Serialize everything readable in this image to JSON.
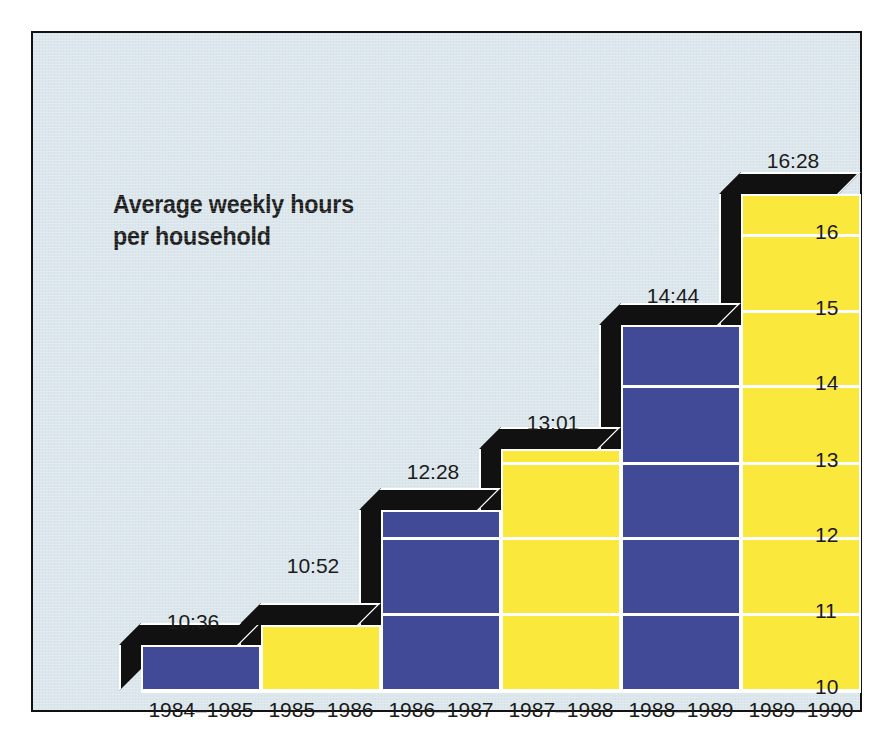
{
  "chart_data": {
    "type": "bar",
    "title": "Average weekly hours\nper household",
    "xlabel": "",
    "ylabel": "",
    "ylim": [
      10,
      16.8
    ],
    "grid": true,
    "legend": "none",
    "categories": [
      "1984–1985",
      "1985–1986",
      "1986–1987",
      "1987–1988",
      "1988–1989",
      "1989–1990"
    ],
    "value_labels": [
      "10:36",
      "10:52",
      "12:28",
      "13:01",
      "14:44",
      "16:28"
    ],
    "values": [
      10.6,
      10.867,
      12.467,
      13.017,
      14.733,
      16.467
    ],
    "bar_colors": [
      "#414a96",
      "#fbe83c",
      "#414a96",
      "#fbe83c",
      "#414a96",
      "#fbe83c"
    ],
    "ytick_labels": [
      "16",
      "15",
      "14",
      "13",
      "12",
      "11",
      "10"
    ],
    "yticks": [
      16,
      15,
      14,
      13,
      12,
      11,
      10
    ],
    "colors": {
      "background": "#dbe7ec",
      "blue": "#414a96",
      "yellow": "#fbe83c",
      "shadow": "#111111",
      "gridline": "#ffffff",
      "border": "#111111",
      "text": "#1b1b1b"
    }
  },
  "axis": {
    "ticks": [
      {
        "label": "16",
        "y": 201
      },
      {
        "label": "15",
        "y": 277
      },
      {
        "label": "14",
        "y": 352
      },
      {
        "label": "13",
        "y": 429
      },
      {
        "label": "12",
        "y": 504
      },
      {
        "label": "11",
        "y": 580
      },
      {
        "label": "10",
        "y": 656
      }
    ]
  },
  "bars": [
    {
      "label": "10:36",
      "cat": "1984–1985",
      "color": "blue",
      "left": 108,
      "top": 612,
      "label_left": 100,
      "label_top": 577
    },
    {
      "label": "10:52",
      "cat": "1985–1986",
      "color": "yellow",
      "left": 228,
      "top": 592,
      "label_left": 220,
      "label_top": 521
    },
    {
      "label": "12:28",
      "cat": "1986–1987",
      "color": "blue",
      "left": 348,
      "top": 477,
      "label_left": 340,
      "label_top": 427
    },
    {
      "label": "13:01",
      "cat": "1987–1988",
      "color": "yellow",
      "left": 468,
      "top": 416,
      "label_left": 460,
      "label_top": 378
    },
    {
      "label": "14:44",
      "cat": "1988–1989",
      "color": "blue",
      "left": 588,
      "top": 292,
      "label_left": 580,
      "label_top": 251
    },
    {
      "label": "16:28",
      "cat": "1989–1990",
      "color": "yellow",
      "left": 708,
      "top": 161,
      "label_left": 700,
      "label_top": 116
    }
  ]
}
